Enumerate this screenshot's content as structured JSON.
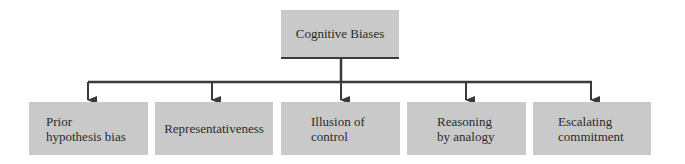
{
  "diagram": {
    "root": {
      "label": "Cognitive Biases"
    },
    "children": [
      {
        "label": "Prior hypothesis bias",
        "line1": "Prior",
        "line2": "hypothesis bias"
      },
      {
        "label": "Representativeness",
        "line1": "Representativeness",
        "line2": ""
      },
      {
        "label": "Illusion of control",
        "line1": "Illusion of",
        "line2": "control"
      },
      {
        "label": "Reasoning by analogy",
        "line1": "Reasoning",
        "line2": "by analogy"
      },
      {
        "label": "Escalating commitment",
        "line1": "Escalating",
        "line2": "commitment"
      }
    ],
    "colors": {
      "box_fill": "#c9c9c9",
      "line": "#3a3a3a",
      "text": "#2a2a2a"
    }
  }
}
